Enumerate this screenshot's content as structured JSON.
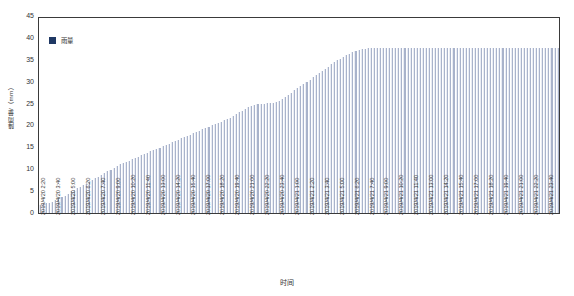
{
  "chart_data": {
    "type": "bar",
    "title": "",
    "subtitle": "",
    "xlabel": "时间",
    "ylabel": "降雨量/（mm）",
    "ylim": [
      0,
      45
    ],
    "yticks": [
      0,
      5,
      10,
      15,
      20,
      25,
      30,
      35,
      40,
      45
    ],
    "grid": false,
    "legend": {
      "position": "top-left-inside",
      "entries": [
        {
          "name": "雨量",
          "color": "#1f3864"
        }
      ]
    },
    "series": [
      {
        "name": "雨量",
        "color": "#a9b3cb",
        "values": [
          1.8,
          2.0,
          2.2,
          2.4,
          2.6,
          2.9,
          3.2,
          3.6,
          4.0,
          4.5,
          5.0,
          5.4,
          5.8,
          6.1,
          6.4,
          6.8,
          7.2,
          7.6,
          8.0,
          8.4,
          8.8,
          9.2,
          9.6,
          10.0,
          10.4,
          10.8,
          11.2,
          11.5,
          11.8,
          12.1,
          12.4,
          12.7,
          13.0,
          13.3,
          13.6,
          13.9,
          14.2,
          14.5,
          14.8,
          15.1,
          15.4,
          15.7,
          16.0,
          16.3,
          16.6,
          16.9,
          17.2,
          17.5,
          17.8,
          18.1,
          18.4,
          18.7,
          19.0,
          19.3,
          19.6,
          19.9,
          20.2,
          20.5,
          20.8,
          21.1,
          21.4,
          21.7,
          22.0,
          22.4,
          22.8,
          23.2,
          23.6,
          24.0,
          24.4,
          24.8,
          25.0,
          25.1,
          25.2,
          25.2,
          25.3,
          25.3,
          25.4,
          25.6,
          25.9,
          26.3,
          26.8,
          27.3,
          27.8,
          28.3,
          28.8,
          29.3,
          29.8,
          30.3,
          30.8,
          31.3,
          31.8,
          32.3,
          32.8,
          33.3,
          33.8,
          34.3,
          34.8,
          35.2,
          35.6,
          36.0,
          36.4,
          36.8,
          37.1,
          37.4,
          37.6,
          37.8,
          37.9,
          38.0,
          38.0,
          38.0,
          38.0,
          38.0,
          38.0,
          38.0,
          38.0,
          38.0,
          38.0,
          38.0,
          38.0,
          38.0,
          38.0,
          38.0,
          38.0,
          38.0,
          38.0,
          38.0,
          38.0,
          38.0,
          38.0,
          38.0,
          38.0,
          38.0,
          38.0,
          38.0,
          38.0,
          38.0,
          38.0,
          38.0,
          38.0,
          38.0,
          38.0,
          38.0,
          38.0,
          38.0,
          38.0,
          38.0,
          38.0,
          38.0,
          38.0,
          38.0,
          38.0,
          38.0,
          38.0,
          38.0,
          38.0,
          38.0,
          38.0,
          38.0,
          38.0,
          38.0,
          38.0,
          38.0,
          38.0,
          38.0,
          38.0,
          38.0,
          38.0,
          38.0,
          38.0,
          38.0
        ]
      }
    ],
    "xtick_labels": [
      "2019/4/20 2:20",
      "2019/4/20 3:40",
      "2019/4/20 5:00",
      "2019/4/20 6:20",
      "2019/4/20 7:40",
      "2019/4/20 9:00",
      "2019/4/20 10:20",
      "2019/4/20 11:40",
      "2019/4/20 13:00",
      "2019/4/20 14:20",
      "2019/4/20 15:40",
      "2019/4/20 17:00",
      "2019/4/20 18:20",
      "2019/4/20 19:40",
      "2019/4/20 21:00",
      "2019/4/20 22:20",
      "2019/4/20 23:40",
      "2019/4/21 1:00",
      "2019/4/21 2:20",
      "2019/4/21 3:40",
      "2019/4/21 5:00",
      "2019/4/21 6:20",
      "2019/4/21 7:40",
      "2019/4/21 9:00",
      "2019/4/21 10:20",
      "2019/4/21 11:40",
      "2019/4/21 13:00",
      "2019/4/21 14:20",
      "2019/4/21 15:40",
      "2019/4/21 17:00",
      "2019/4/21 18:20",
      "2019/4/21 19:40",
      "2019/4/21 21:00",
      "2019/4/21 22:20",
      "2019/4/21 23:40"
    ]
  }
}
